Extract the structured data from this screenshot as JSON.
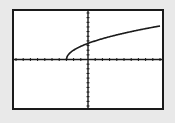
{
  "colors": {
    "background": "#e9e9e9",
    "screen": "#ffffff",
    "ink": "#1a1a1a"
  },
  "chart_data": {
    "type": "line",
    "title": "",
    "xlabel": "",
    "ylabel": "",
    "function": "y = 2*sqrt(x+3)",
    "xlim": [
      -10,
      10
    ],
    "ylim": [
      -10,
      10
    ],
    "xscl": 1,
    "yscl": 1,
    "grid": false,
    "legend": null,
    "series": [
      {
        "name": "Y1",
        "x": [
          -3,
          -2.5,
          -2,
          -1,
          0,
          1,
          2,
          3,
          4,
          5,
          6,
          7,
          8,
          9,
          10
        ],
        "values": [
          0,
          1.41,
          2.0,
          2.83,
          3.46,
          4.0,
          4.47,
          4.9,
          5.29,
          5.66,
          6.0,
          6.32,
          6.63,
          6.93,
          7.21
        ]
      }
    ]
  }
}
